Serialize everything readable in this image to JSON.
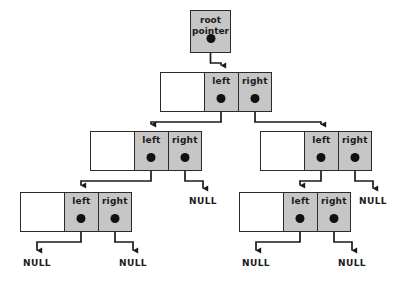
{
  "diagram": {
    "colors": {
      "pointer_cell_fill": "#c6c6c6",
      "data_cell_fill": "#ffffff",
      "border": "#2b2b2b",
      "dot": "#111111",
      "connector": "#1a1a1a",
      "background": "#ffffff"
    },
    "labels": {
      "left": "left",
      "right": "right",
      "null": "NULL",
      "root_line1": "root",
      "root_line2": "pointer"
    }
  },
  "root_pointer": {
    "name": "root-pointer",
    "line1": "root",
    "line2": "pointer",
    "x": 190,
    "y": 10,
    "w": 41,
    "h": 43
  },
  "nodes": [
    {
      "id": "node-level2",
      "level": 2,
      "x": 160,
      "y": 72,
      "w": 112,
      "h": 40,
      "data_w": 44,
      "left_label": "left",
      "right_label": "right",
      "left_child": "node-level3-left",
      "right_child": "node-level3-right"
    },
    {
      "id": "node-level3-left",
      "level": 3,
      "x": 90,
      "y": 131,
      "w": 112,
      "h": 40,
      "data_w": 44,
      "left_label": "left",
      "right_label": "right",
      "left_child": "node-level4-left",
      "right_child": "null-mid-left"
    },
    {
      "id": "node-level3-right",
      "level": 3,
      "x": 260,
      "y": 131,
      "w": 112,
      "h": 40,
      "data_w": 44,
      "left_label": "left",
      "right_label": "right",
      "left_child": "node-level4-right",
      "right_child": "null-mid-right"
    },
    {
      "id": "node-level4-left",
      "level": 4,
      "x": 20,
      "y": 192,
      "w": 112,
      "h": 40,
      "data_w": 44,
      "left_label": "left",
      "right_label": "right",
      "left_child": "null-bottom-1",
      "right_child": "null-bottom-2"
    },
    {
      "id": "node-level4-right",
      "level": 4,
      "x": 239,
      "y": 192,
      "w": 112,
      "h": 40,
      "data_w": 44,
      "left_label": "left",
      "right_label": "right",
      "left_child": "null-bottom-3",
      "right_child": "null-bottom-4"
    }
  ],
  "null_labels": [
    {
      "id": "null-mid-left",
      "text": "NULL",
      "x": 203,
      "y": 196
    },
    {
      "id": "null-mid-right",
      "text": "NULL",
      "x": 373,
      "y": 196
    },
    {
      "id": "null-bottom-1",
      "text": "NULL",
      "x": 37,
      "y": 258
    },
    {
      "id": "null-bottom-2",
      "text": "NULL",
      "x": 133,
      "y": 258
    },
    {
      "id": "null-bottom-3",
      "text": "NULL",
      "x": 256,
      "y": 258
    },
    {
      "id": "null-bottom-4",
      "text": "NULL",
      "x": 352,
      "y": 258
    }
  ],
  "connectors": [
    {
      "id": "conn-root-to-level2",
      "from": "root-pointer",
      "to": "node-level2"
    },
    {
      "id": "conn-l2-left-to-l3left",
      "from": "node-level2",
      "to": "node-level3-left"
    },
    {
      "id": "conn-l2-right-to-l3right",
      "from": "node-level2",
      "to": "node-level3-right"
    },
    {
      "id": "conn-l3left-left-to-l4left",
      "from": "node-level3-left",
      "to": "node-level4-left"
    },
    {
      "id": "conn-l3left-right-to-null",
      "from": "node-level3-left",
      "to": "null-mid-left"
    },
    {
      "id": "conn-l3right-left-to-l4right",
      "from": "node-level3-right",
      "to": "node-level4-right"
    },
    {
      "id": "conn-l3right-right-to-null",
      "from": "node-level3-right",
      "to": "null-mid-right"
    },
    {
      "id": "conn-l4left-left-to-null",
      "from": "node-level4-left",
      "to": "null-bottom-1"
    },
    {
      "id": "conn-l4left-right-to-null",
      "from": "node-level4-left",
      "to": "null-bottom-2"
    },
    {
      "id": "conn-l4right-left-to-null",
      "from": "node-level4-right",
      "to": "null-bottom-3"
    },
    {
      "id": "conn-l4right-right-to-null",
      "from": "node-level4-right",
      "to": "null-bottom-4"
    }
  ]
}
